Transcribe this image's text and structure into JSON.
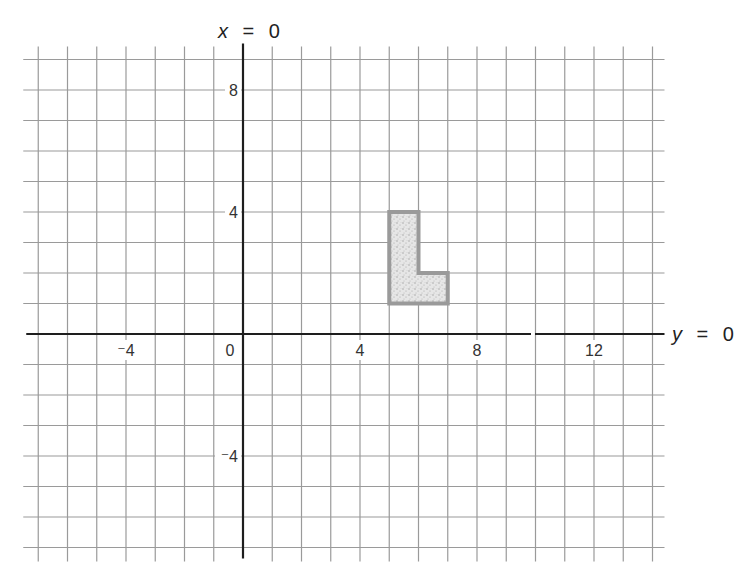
{
  "chart_data": {
    "type": "scatter",
    "title": "",
    "subtitle": "",
    "xlabel": "y = 0",
    "ylabel": "x = 0",
    "axis_labels": {
      "horizontal_axis": {
        "var": "y",
        "eq": "=",
        "val": "0"
      },
      "vertical_axis": {
        "var": "x",
        "eq": "=",
        "val": "0"
      }
    },
    "xlim": [
      -7,
      14
    ],
    "ylim": [
      -7,
      9
    ],
    "grid": true,
    "grid_step": 1,
    "x_ticks": [
      {
        "value": -4,
        "label": "⁻4"
      },
      {
        "value": 0,
        "label": "0"
      },
      {
        "value": 4,
        "label": "4"
      },
      {
        "value": 8,
        "label": "8"
      },
      {
        "value": 12,
        "label": "12"
      }
    ],
    "y_ticks": [
      {
        "value": 8,
        "label": "8"
      },
      {
        "value": 4,
        "label": "4"
      },
      {
        "value": -4,
        "label": "⁻4"
      }
    ],
    "shapes": [
      {
        "name": "L-shape",
        "description": "Shaded L-shaped polygon",
        "vertices": [
          [
            5,
            1
          ],
          [
            7,
            1
          ],
          [
            7,
            2
          ],
          [
            6,
            2
          ],
          [
            6,
            4
          ],
          [
            5,
            4
          ]
        ],
        "fill": "stippled light gray",
        "outline_color": "#9a9a9a"
      }
    ],
    "legend": null
  },
  "layout": {
    "origin_px": [
      243,
      334
    ],
    "unit_px_x": 29.25,
    "unit_px_y": 30.5,
    "axis_break_x_px": [
      531,
      535
    ]
  },
  "colors": {
    "grid": "#9a9a9a",
    "axis": "#1e1e1e",
    "shape_outline": "#9a9a9a",
    "shape_fill": "#dcdcdc",
    "text": "#333333"
  }
}
